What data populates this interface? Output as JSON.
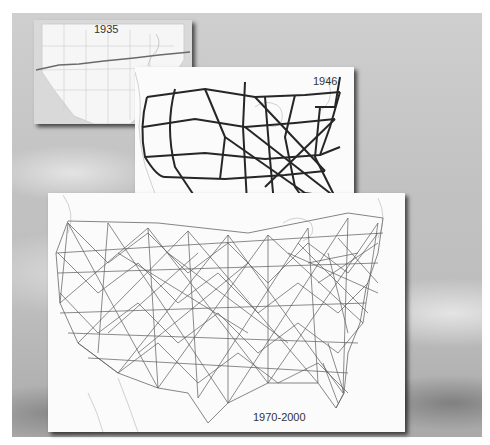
{
  "figure": {
    "panels": [
      {
        "label": "1935",
        "description": "Single transcontinental route across U.S. state outline map"
      },
      {
        "label": "1946",
        "description": "Sparse national network of major routes"
      },
      {
        "label": "1970-2000",
        "description": "Dense interconnected national network"
      }
    ]
  },
  "colors": {
    "background_sky": "#c4c4c4",
    "panel_bg": "#fbfbfb",
    "route_1946": "#2a2a2a",
    "route_1970": "#555555",
    "outline": "#b8b8b8"
  }
}
